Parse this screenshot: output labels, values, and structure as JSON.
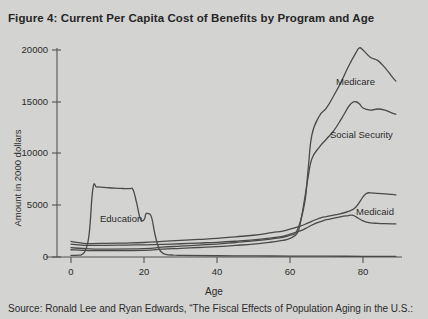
{
  "figure": {
    "title": "Figure 4: Current Per Capita Cost of Benefits by Program and Age",
    "source": "Source: Ronald Lee and Ryan Edwards, “The Fiscal Effects of Population Aging in the U.S.:"
  },
  "axis": {
    "x_title": "Age",
    "y_title": "Amount in 2000 dollars",
    "x_ticks": [
      "0",
      "20",
      "40",
      "60",
      "80"
    ],
    "y_ticks": [
      "0",
      "5000",
      "10000",
      "15000",
      "20000"
    ]
  },
  "labels": {
    "education": "Education",
    "medicare": "Medicare",
    "social_security": "Social Security",
    "medicaid": "Medicaid"
  },
  "colors": {
    "background": "#d3d3d1",
    "ink": "#2b2b2b",
    "curve": "#4a4a4a",
    "axis": "#555555"
  },
  "chart_data": {
    "type": "line",
    "title": "Figure 4: Current Per Capita Cost of Benefits by Program and Age",
    "xlabel": "Age",
    "ylabel": "Amount in 2000 dollars",
    "xlim": [
      0,
      90
    ],
    "ylim": [
      0,
      21000
    ],
    "xticks": [
      0,
      20,
      40,
      60,
      80
    ],
    "yticks": [
      0,
      5000,
      10000,
      15000,
      20000
    ],
    "grid": false,
    "legend": "inline-annotations",
    "series": [
      {
        "name": "Education",
        "x": [
          0,
          1,
          2,
          3,
          4,
          5,
          6,
          7,
          8,
          10,
          12,
          14,
          16,
          17,
          18,
          19,
          20,
          20.5,
          21,
          22,
          23,
          24,
          25,
          26,
          28,
          30,
          40,
          50,
          60,
          70,
          80,
          89
        ],
        "values": [
          150,
          160,
          180,
          250,
          700,
          2300,
          6600,
          6750,
          6760,
          6700,
          6650,
          6620,
          6600,
          6500,
          5200,
          3700,
          3600,
          4150,
          4200,
          3900,
          2200,
          900,
          420,
          260,
          180,
          150,
          120,
          100,
          90,
          80,
          70,
          60
        ]
      },
      {
        "name": "Medicare",
        "x": [
          0,
          5,
          10,
          20,
          25,
          30,
          35,
          40,
          45,
          50,
          55,
          58,
          60,
          62,
          64,
          65,
          66,
          68,
          70,
          72,
          74,
          76,
          78,
          79,
          80,
          82,
          84,
          86,
          88,
          89
        ],
        "values": [
          900,
          780,
          760,
          800,
          950,
          1050,
          1150,
          1250,
          1400,
          1550,
          1750,
          1900,
          2100,
          2600,
          5200,
          8600,
          11800,
          13600,
          14400,
          15600,
          16900,
          18400,
          19700,
          20200,
          20000,
          19300,
          19000,
          18300,
          17400,
          17000
        ]
      },
      {
        "name": "Social Security",
        "x": [
          0,
          5,
          10,
          20,
          25,
          30,
          35,
          40,
          45,
          50,
          55,
          58,
          60,
          62,
          63,
          64,
          65,
          66,
          68,
          70,
          72,
          74,
          76,
          77,
          78,
          79,
          80,
          82,
          84,
          86,
          88,
          89
        ],
        "values": [
          700,
          620,
          610,
          640,
          760,
          840,
          920,
          1000,
          1120,
          1250,
          1450,
          1600,
          1800,
          2300,
          3600,
          5600,
          7800,
          9500,
          10600,
          11400,
          12200,
          13300,
          14500,
          14900,
          15000,
          14800,
          14400,
          14200,
          14300,
          14200,
          13900,
          13800
        ]
      },
      {
        "name": "Medicaid",
        "x": [
          0,
          3,
          5,
          10,
          15,
          20,
          25,
          30,
          35,
          40,
          45,
          50,
          55,
          58,
          60,
          63,
          65,
          67,
          69,
          70,
          72,
          74,
          76,
          78,
          80,
          81,
          82,
          84,
          86,
          88,
          89
        ],
        "values": [
          1500,
          1350,
          1300,
          1320,
          1350,
          1400,
          1500,
          1600,
          1700,
          1800,
          1950,
          2100,
          2350,
          2500,
          2700,
          3000,
          3300,
          3600,
          3850,
          3900,
          4050,
          4200,
          4400,
          4800,
          5800,
          6150,
          6200,
          6150,
          6100,
          6050,
          6000
        ]
      },
      {
        "name": "Other benefits",
        "x": [
          0,
          3,
          5,
          10,
          15,
          20,
          25,
          30,
          35,
          40,
          45,
          50,
          55,
          58,
          60,
          63,
          65,
          67,
          69,
          70,
          72,
          74,
          76,
          77,
          78,
          80,
          82,
          84,
          86,
          88,
          89
        ],
        "values": [
          1250,
          1150,
          1120,
          1130,
          1150,
          1180,
          1220,
          1280,
          1350,
          1420,
          1520,
          1650,
          1850,
          2000,
          2200,
          2550,
          2900,
          3250,
          3500,
          3600,
          3750,
          3900,
          4000,
          4050,
          3900,
          3500,
          3300,
          3250,
          3220,
          3200,
          3200
        ]
      }
    ]
  }
}
